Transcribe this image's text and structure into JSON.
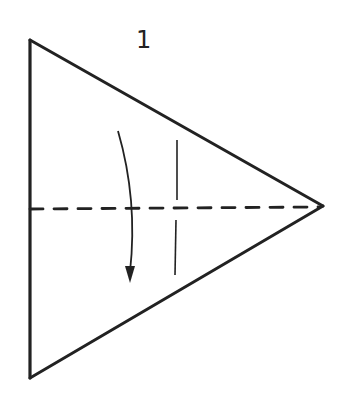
{
  "diagram": {
    "step_number": "1",
    "colors": {
      "stroke": "#222222",
      "background": "#ffffff"
    },
    "shape": "triangle",
    "elements": [
      {
        "name": "triangle-outline",
        "type": "solid-line"
      },
      {
        "name": "center-fold-line",
        "type": "valley-fold-dashed"
      },
      {
        "name": "fold-direction-arrow",
        "type": "curved-arrow-down"
      },
      {
        "name": "fold-reference-line",
        "type": "thin-vertical-line"
      }
    ]
  }
}
